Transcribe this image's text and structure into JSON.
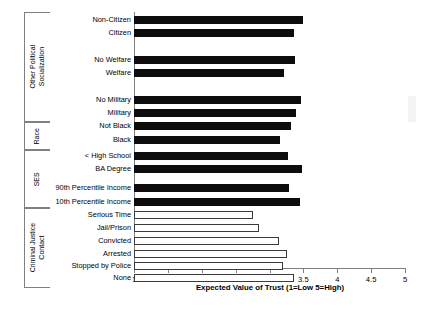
{
  "chart_data": {
    "type": "bar",
    "orientation": "horizontal",
    "title": "",
    "xlabel": "Expected Value of Trust (1=Low 5=High)",
    "ylabel": "",
    "xlim": [
      1,
      5
    ],
    "xticks": [
      "1",
      "1.5",
      "2",
      "2.5",
      "3",
      "3.5",
      "4",
      "4.5",
      "5"
    ],
    "xtick_values": [
      1,
      1.5,
      2,
      2.5,
      3,
      3.5,
      4,
      4.5,
      5
    ],
    "grid": false,
    "legend": "none",
    "groups": [
      {
        "name": "Other Political Socialization",
        "name_line1": "Other Political",
        "name_line2": "Socialization",
        "categories": [
          "Non-Citizen",
          "Citizen",
          "No Welfare",
          "Welfare",
          "No Military",
          "Military"
        ],
        "values": [
          3.49,
          3.36,
          3.38,
          3.21,
          3.46,
          3.39
        ],
        "style": "filled"
      },
      {
        "name": "Race",
        "name_line1": "Race",
        "name_line2": "",
        "categories": [
          "Not Black",
          "Black"
        ],
        "values": [
          3.32,
          3.15
        ],
        "style": "filled"
      },
      {
        "name": "SES",
        "name_line1": "SES",
        "name_line2": "",
        "categories": [
          "< High School",
          "BA Degree",
          "90th Percentile Income",
          "10th Percentile Income"
        ],
        "values": [
          3.27,
          3.48,
          3.29,
          3.45
        ],
        "style": "filled"
      },
      {
        "name": "Criminal Justice Contact",
        "name_line1": "Criminal Justice",
        "name_line2": "Contact",
        "categories": [
          "Serious Time",
          "Jail/Prison",
          "Convicted",
          "Arrested",
          "Stopped by Police",
          "None"
        ],
        "values": [
          2.76,
          2.85,
          3.14,
          3.26,
          3.2,
          3.36
        ],
        "style": "hollow"
      }
    ],
    "categories": [
      "Non-Citizen",
      "Citizen",
      "No Welfare",
      "Welfare",
      "No Military",
      "Military",
      "Not Black",
      "Black",
      "< High School",
      "BA Degree",
      "90th Percentile Income",
      "10th Percentile Income",
      "Serious Time",
      "Jail/Prison",
      "Convicted",
      "Arrested",
      "Stopped by Police",
      "None"
    ],
    "values": [
      3.49,
      3.36,
      3.38,
      3.21,
      3.46,
      3.39,
      3.32,
      3.15,
      3.27,
      3.48,
      3.29,
      3.45,
      2.76,
      2.85,
      3.14,
      3.26,
      3.2,
      3.36
    ],
    "colors": {
      "filled_bar": "#0d0d0d",
      "hollow_bar_fill": "#ffffff",
      "hollow_bar_border": "#3a3a3a",
      "axis": "#808080",
      "text": "#000000"
    }
  }
}
